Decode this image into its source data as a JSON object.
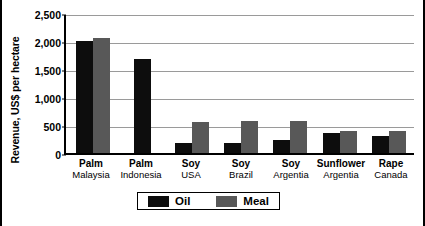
{
  "chart_data": {
    "type": "bar",
    "title": "",
    "xlabel": "",
    "ylabel": "Revenue, US$ per hectare",
    "ylim": [
      0,
      2500
    ],
    "yticks": [
      0,
      500,
      1000,
      1500,
      2000,
      2500
    ],
    "ytick_labels": [
      "0",
      "500",
      "1,000",
      "1,500",
      "2,000",
      "2,500"
    ],
    "grid": true,
    "legend_position": "bottom-center",
    "categories": [
      {
        "crop": "Palm",
        "country": "Malaysia"
      },
      {
        "crop": "Palm",
        "country": "Indonesia"
      },
      {
        "crop": "Soy",
        "country": "USA"
      },
      {
        "crop": "Soy",
        "country": "Brazil"
      },
      {
        "crop": "Soy",
        "country": "Argentia"
      },
      {
        "crop": "Sunflower",
        "country": "Argentia"
      },
      {
        "crop": "Rape",
        "country": "Canada"
      }
    ],
    "series": [
      {
        "name": "Oil",
        "color": "#0d0d0d",
        "values": [
          2000,
          1670,
          180,
          180,
          230,
          350,
          310
        ]
      },
      {
        "name": "Meal",
        "color": "#585858",
        "values": [
          2050,
          0,
          560,
          570,
          570,
          400,
          390
        ]
      }
    ]
  },
  "legend": {
    "items": [
      {
        "label": "Oil",
        "color": "#0d0d0d"
      },
      {
        "label": "Meal",
        "color": "#585858"
      }
    ]
  }
}
